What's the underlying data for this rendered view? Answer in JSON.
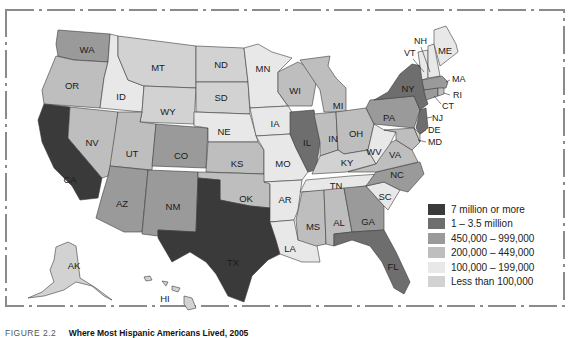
{
  "figure": {
    "caption_number": "FIGURE 2.2",
    "caption_title": "Where Most Hispanic Americans Lived, 2005"
  },
  "legend": {
    "items": [
      {
        "label": "7 million or more",
        "color": "#3a3a3a"
      },
      {
        "label": "1 – 3.5 million",
        "color": "#6e6e6e"
      },
      {
        "label": "450,000 – 999,000",
        "color": "#9a9a9a"
      },
      {
        "label": "200,000 – 449,000",
        "color": "#bebebe"
      },
      {
        "label": "100,000 – 199,000",
        "color": "#e8e8e8"
      },
      {
        "label": "Less than 100,000",
        "color": "#d2d2d2"
      }
    ]
  },
  "states": {
    "WA": "WA",
    "OR": "OR",
    "CA": "CA",
    "ID": "ID",
    "NV": "NV",
    "MT": "MT",
    "WY": "WY",
    "UT": "UT",
    "AZ": "AZ",
    "CO": "CO",
    "NM": "NM",
    "ND": "ND",
    "SD": "SD",
    "NE": "NE",
    "KS": "KS",
    "OK": "OK",
    "TX": "TX",
    "MN": "MN",
    "IA": "IA",
    "MO": "MO",
    "AR": "AR",
    "LA": "LA",
    "WI": "WI",
    "IL": "IL",
    "MI": "MI",
    "IN": "IN",
    "OH": "OH",
    "KY": "KY",
    "TN": "TN",
    "MS": "MS",
    "AL": "AL",
    "GA": "GA",
    "FL": "FL",
    "SC": "SC",
    "NC": "NC",
    "VA": "VA",
    "WV": "WV",
    "PA": "PA",
    "NY": "NY",
    "VT": "VT",
    "NH": "NH",
    "ME": "ME",
    "MA": "MA",
    "RI": "RI",
    "CT": "CT",
    "NJ": "NJ",
    "DE": "DE",
    "MD": "MD",
    "AK": "AK",
    "HI": "HI"
  }
}
